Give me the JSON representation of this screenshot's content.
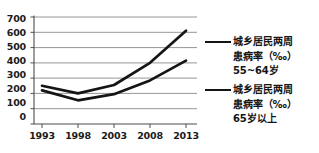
{
  "chart_data": {
    "type": "line",
    "title": "",
    "xlabel": "",
    "ylabel": "",
    "categories": [
      "1993",
      "1998",
      "2003",
      "2008",
      "2013"
    ],
    "x": [
      1993,
      1998,
      2003,
      2008,
      2013
    ],
    "ylim": [
      0,
      700
    ],
    "yticks": [
      0,
      100,
      200,
      300,
      400,
      500,
      600,
      700
    ],
    "ytick_labels": [
      "0",
      "100",
      "200",
      "300",
      "400",
      "500",
      "600",
      "700"
    ],
    "grid": true,
    "grid_axis": "y",
    "legend_position": "right",
    "series": [
      {
        "name": "城乡居民两周患病率（‰）55~64岁",
        "values": [
          250,
          200,
          255,
          400,
          610
        ],
        "color": "#151515"
      },
      {
        "name": "城乡居民两周患病率（‰）65岁以上",
        "values": [
          220,
          155,
          195,
          285,
          415
        ],
        "color": "#151515"
      }
    ]
  },
  "legend": {
    "entries": [
      {
        "label": "城乡居民两周\n患病率（‰）\n55~64岁",
        "swatch": "line-swatch-series-1"
      },
      {
        "label": "城乡居民两周\n患病率（‰）\n65岁以上",
        "swatch": "line-swatch-series-2"
      }
    ]
  },
  "axis": {
    "y_tick_labels": [
      "700",
      "600",
      "500",
      "400",
      "300",
      "200",
      "100",
      "0"
    ],
    "x_tick_labels": [
      "1993",
      "1998",
      "2003",
      "2008",
      "2013"
    ]
  },
  "colors": {
    "line": "#151515",
    "grid": "#808080",
    "axis": "#4d4d4d",
    "text": "#141414",
    "background": "#ffffff"
  }
}
